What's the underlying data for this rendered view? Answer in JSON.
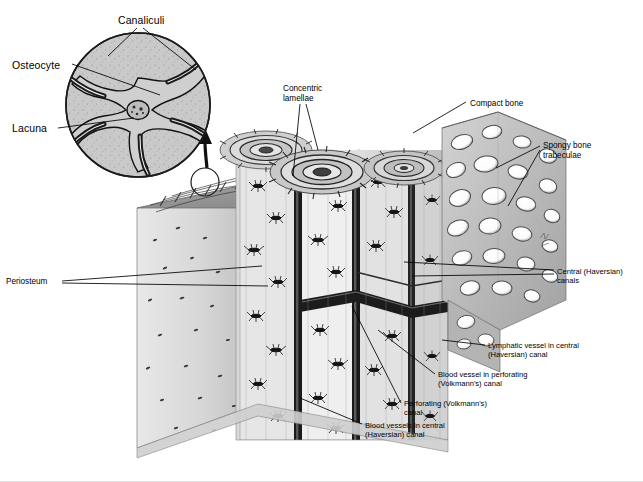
{
  "figure": {
    "background_color": "#ffffff",
    "ink_color": "#000000"
  },
  "inset": {
    "name": "osteocyte-detail-circle",
    "shape": "circle",
    "center": [
      138,
      105
    ],
    "radius": 73,
    "fill_color": "#c9c9c9",
    "labels": [
      {
        "key": "canaliculi",
        "text": "Canaliculi",
        "x": 118,
        "y": 14,
        "size": "lg",
        "leader": "two-prong-down"
      },
      {
        "key": "osteocyte",
        "text": "Osteocyte",
        "x": 12,
        "y": 59,
        "size": "lg",
        "leader": "single-right"
      },
      {
        "key": "lacuna",
        "text": "Lacuna",
        "x": 12,
        "y": 122,
        "size": "lg",
        "leader": "single-right"
      }
    ]
  },
  "callout_arrow": {
    "name": "magnify-arrow",
    "source_circle_center": [
      205,
      182
    ],
    "source_circle_radius": 14,
    "direction": "up-to-inset"
  },
  "labels": [
    {
      "key": "concentric-lamellae",
      "text": "Concentric\nlamellae",
      "x": 283,
      "y": 84,
      "size": "md",
      "leader": "two-prong-down"
    },
    {
      "key": "compact-bone",
      "text": "Compact bone",
      "x": 470,
      "y": 99,
      "size": "md",
      "leader": "single-left-down"
    },
    {
      "key": "spongy-bone-trabeculae",
      "text": "Spongy bone\ntrabeculae",
      "x": 543,
      "y": 141,
      "size": "md",
      "leader": "two-prong-left"
    },
    {
      "key": "central-haversian-canals",
      "text": "Central (Haversian)\ncanals",
      "x": 557,
      "y": 268,
      "size": "sm",
      "leader": "two-prong-left"
    },
    {
      "key": "lymphatic-vessel",
      "text": "Lymphatic vessel in central\n(Haversian) canal",
      "x": 488,
      "y": 342,
      "size": "sm",
      "leader": "single-left"
    },
    {
      "key": "blood-vessel-perforating",
      "text": "Blood vessel in perforating\n(Volkmann's) canal",
      "x": 438,
      "y": 371,
      "size": "sm",
      "leader": "single-left-up"
    },
    {
      "key": "perforating-canal",
      "text": "Perforating (Volkmann's)\ncanal",
      "x": 404,
      "y": 400,
      "size": "sm",
      "leader": "single-left-up"
    },
    {
      "key": "blood-vessels-central",
      "text": "Blood vessels in central\n(Haversian) canal",
      "x": 365,
      "y": 422,
      "size": "sm",
      "leader": "single-left-up"
    },
    {
      "key": "periosteum",
      "text": "Periosteum",
      "x": 6,
      "y": 277,
      "size": "md",
      "leader": "two-prong-right"
    }
  ]
}
